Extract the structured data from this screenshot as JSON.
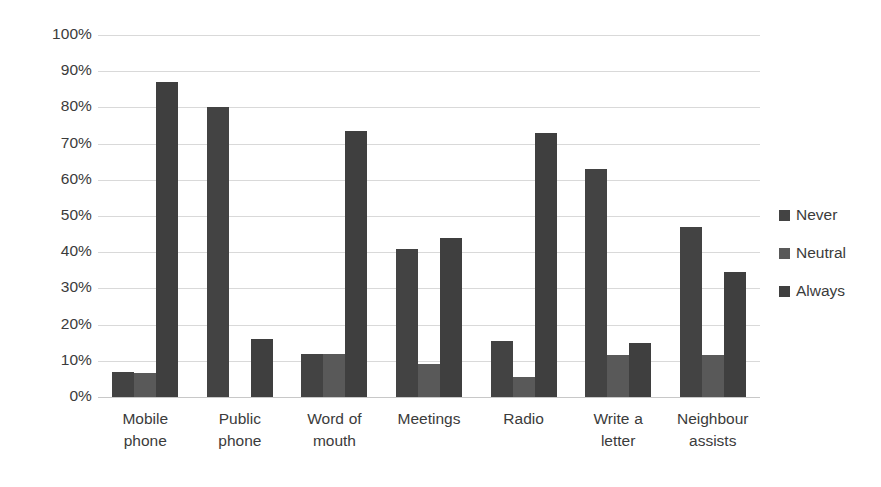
{
  "chart_data": {
    "type": "bar",
    "title": "",
    "subtitle": "",
    "xlabel": "",
    "ylabel": "",
    "ylim": [
      0,
      100
    ],
    "ytick_labels": [
      "100%",
      "90%",
      "80%",
      "70%",
      "60%",
      "50%",
      "40%",
      "30%",
      "20%",
      "10%",
      "0%"
    ],
    "ytick_values": [
      100,
      90,
      80,
      70,
      60,
      50,
      40,
      30,
      20,
      10,
      0
    ],
    "grid": true,
    "legend_position": "right",
    "categories": [
      "Mobile phone",
      "Public phone",
      "Word of mouth",
      "Meetings",
      "Radio",
      "Write a letter",
      "Neighbour assists"
    ],
    "category_lines": [
      [
        "Mobile",
        "phone"
      ],
      [
        "Public",
        "phone"
      ],
      [
        "Word of",
        "mouth"
      ],
      [
        "Meetings"
      ],
      [
        "Radio"
      ],
      [
        "Write a",
        "letter"
      ],
      [
        "Neighbour",
        "assists"
      ]
    ],
    "series": [
      {
        "name": "Never",
        "color": "#434343",
        "values": [
          7,
          80,
          12,
          41,
          15.5,
          63,
          47
        ]
      },
      {
        "name": "Neutral",
        "color": "#595959",
        "values": [
          6.5,
          0,
          12,
          9,
          5.5,
          11.5,
          11.5
        ]
      },
      {
        "name": "Always",
        "color": "#3f3f3f",
        "values": [
          87,
          16,
          73.5,
          44,
          73,
          15,
          34.5
        ]
      }
    ]
  },
  "legend": {
    "items": [
      {
        "label": "Never",
        "swatch_color": "#434343"
      },
      {
        "label": "Neutral",
        "swatch_color": "#595959"
      },
      {
        "label": "Always",
        "swatch_color": "#3f3f3f"
      }
    ]
  },
  "colors": {
    "background": "#ffffff",
    "gridline": "#d9d9d9",
    "axis": "#c8c8c8",
    "text": "#3b3b3b"
  }
}
